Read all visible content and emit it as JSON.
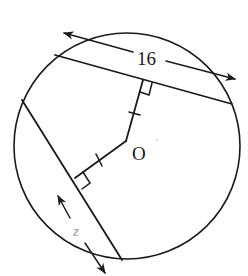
{
  "diagram": {
    "type": "circle-chord-geometry",
    "circle": {
      "cx": 127,
      "cy": 146,
      "r": 113
    },
    "center_label": "O",
    "top_chord": {
      "length_label": "16"
    },
    "left_chord": {
      "length_label": "z"
    },
    "markings": {
      "right_angles": 2,
      "congruent_tick_marks": 2,
      "description": "Both perpendicular distances from center O to the chords are marked congruent (single tick each)."
    },
    "colors": {
      "line": "#1a1a1a",
      "z_label": "#9a9a9a",
      "background": "#ffffff"
    }
  }
}
